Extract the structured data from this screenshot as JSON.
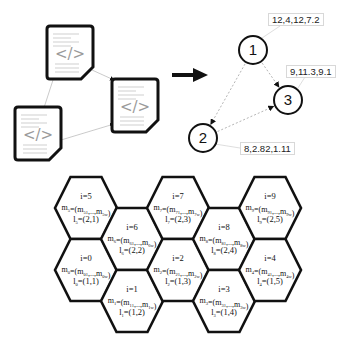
{
  "left_panel": {
    "documents": [
      {
        "id": "doc-1",
        "glyph": "</>",
        "x": 47,
        "y": 26
      },
      {
        "id": "doc-2",
        "glyph": "</>",
        "x": 112,
        "y": 79
      },
      {
        "id": "doc-3",
        "glyph": "</>",
        "x": 15,
        "y": 107
      }
    ]
  },
  "transform_arrow": {
    "icon": "right-arrow-icon"
  },
  "graph": {
    "nodes": [
      {
        "label": "1",
        "cx": 253,
        "cy": 50
      },
      {
        "label": "2",
        "cx": 203,
        "cy": 138
      },
      {
        "label": "3",
        "cx": 288,
        "cy": 100
      }
    ],
    "edges": [
      {
        "from": "1",
        "to": "3"
      },
      {
        "from": "1",
        "to": "2"
      },
      {
        "from": "2",
        "to": "3"
      }
    ],
    "vectors": [
      {
        "node": "1",
        "text": "12,4,12,7.2"
      },
      {
        "node": "3",
        "text": "9,11.3,9.1"
      },
      {
        "node": "2",
        "text": "8,2.82,1.11"
      }
    ]
  },
  "hex_grid": {
    "cells": [
      {
        "i": "i=5",
        "m_sub": "5",
        "m_first": "51",
        "m_last": "5w",
        "l_sub": "5",
        "l": "(2,1)",
        "cx": 86,
        "cy": 208
      },
      {
        "i": "i=0",
        "m_sub": "0",
        "m_first": "01",
        "m_last": "0w",
        "l_sub": "0",
        "l": "(1,1)",
        "cx": 86,
        "cy": 270
      },
      {
        "i": "i=6",
        "m_sub": "6",
        "m_first": "61",
        "m_last": "6w",
        "l_sub": "6",
        "l": "(2,2)",
        "cx": 132,
        "cy": 239
      },
      {
        "i": "i=1",
        "m_sub": "1",
        "m_first": "11",
        "m_last": "1w",
        "l_sub": "1",
        "l": "(1,2)",
        "cx": 132,
        "cy": 301
      },
      {
        "i": "i=7",
        "m_sub": "7",
        "m_first": "71",
        "m_last": "7w",
        "l_sub": "7",
        "l": "(2,3)",
        "cx": 178,
        "cy": 208
      },
      {
        "i": "i=2",
        "m_sub": "2",
        "m_first": "21",
        "m_last": "2w",
        "l_sub": "2",
        "l": "(1,3)",
        "cx": 178,
        "cy": 270
      },
      {
        "i": "i=8",
        "m_sub": "8",
        "m_first": "81",
        "m_last": "8w",
        "l_sub": "8",
        "l": "(2,4)",
        "cx": 224,
        "cy": 239
      },
      {
        "i": "i=3",
        "m_sub": "3",
        "m_first": "31",
        "m_last": "3w",
        "l_sub": "3",
        "l": "(1,4)",
        "cx": 224,
        "cy": 301
      },
      {
        "i": "i=9",
        "m_sub": "9",
        "m_first": "91",
        "m_last": "9w",
        "l_sub": "9",
        "l": "(2,5)",
        "cx": 270,
        "cy": 208
      },
      {
        "i": "i=4",
        "m_sub": "4",
        "m_first": "41",
        "m_last": "4w",
        "l_sub": "4",
        "l": "(1,5)",
        "cx": 270,
        "cy": 270
      }
    ]
  },
  "colors": {
    "stroke": "#111111",
    "edge": "#b0b0b0",
    "doc_text": "#9a9a9a"
  }
}
